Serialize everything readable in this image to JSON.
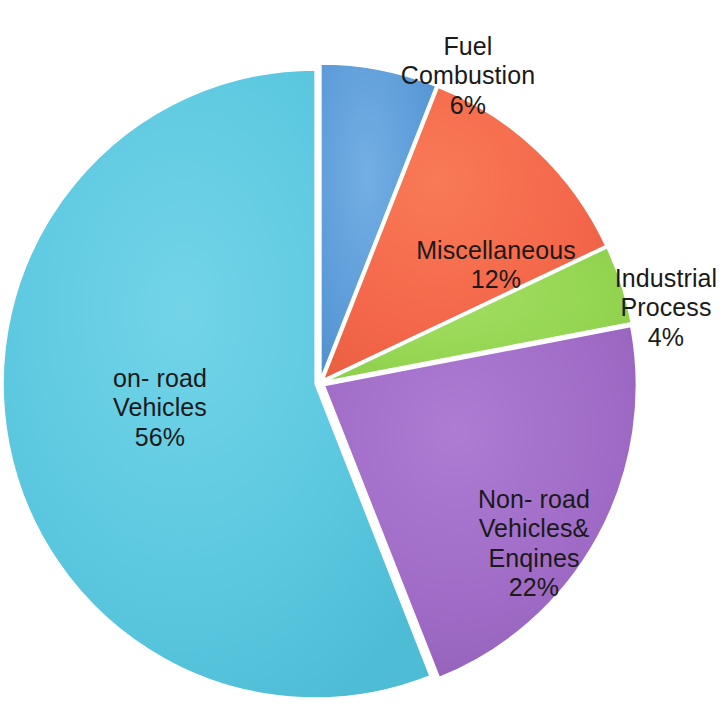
{
  "chart_data": {
    "type": "pie",
    "title": "",
    "subtitle": "",
    "xlabel": "",
    "ylabel": "",
    "legend_position": "none",
    "grid": false,
    "unit": "%",
    "start_angle_deg": 0,
    "direction": "clockwise",
    "categories": [
      "Fuel Combustion",
      "Miscellaneous",
      "Industrial Process",
      "Non- road Vehicles& Enqines",
      "on- road Vehicles"
    ],
    "values": [
      6,
      12,
      4,
      22,
      56
    ],
    "slices": [
      {
        "id": "fuel-combustion",
        "name": "Fuel Combustion",
        "label_line1": "Fuel",
        "label_line2": "Combustion",
        "value": 6,
        "value_label": "6%",
        "color": "#5b9bd8",
        "start_deg": 0,
        "end_deg": 21.6
      },
      {
        "id": "miscellaneous",
        "name": "Miscellaneous",
        "label_line1": "Miscellaneous",
        "label_line2": "",
        "value": 12,
        "value_label": "12%",
        "color": "#f4674a",
        "start_deg": 21.6,
        "end_deg": 64.8
      },
      {
        "id": "industrial-process",
        "name": "Industrial Process",
        "label_line1": "Industrial",
        "label_line2": "Process",
        "value": 4,
        "value_label": "4%",
        "color": "#93d551",
        "start_deg": 64.8,
        "end_deg": 79.2
      },
      {
        "id": "nonroad-vehicles-engines",
        "name": "Non- road Vehicles& Enqines",
        "label_line1": "Non- road",
        "label_line2": "Vehicles&",
        "label_line3": "Enqines",
        "value": 22,
        "value_label": "22%",
        "color": "#9f6bc6",
        "start_deg": 79.2,
        "end_deg": 158.4
      },
      {
        "id": "onroad-vehicles",
        "name": "on- road Vehicles",
        "label_line1": "on- road",
        "label_line2": "Vehicles",
        "value": 56,
        "value_label": "56%",
        "color": "#5bc8e0",
        "start_deg": 158.4,
        "end_deg": 360
      }
    ]
  },
  "labels": {
    "fuel_combustion": "Fuel\nCombustion",
    "fuel_combustion_pct": "6%",
    "miscellaneous": "Miscellaneous",
    "miscellaneous_pct": "12%",
    "industrial_process": "Industrial\nProcess",
    "industrial_process_pct": "4%",
    "nonroad": "Non- road\nVehicles&\nEnqines",
    "nonroad_pct": "22%",
    "onroad": "on- road\nVehicles",
    "onroad_pct": "56%"
  },
  "colors": {
    "fuel_combustion": "#5b9bd8",
    "miscellaneous": "#f4674a",
    "industrial_process": "#93d551",
    "nonroad": "#9f6bc6",
    "onroad": "#5bc8e0",
    "background": "#ffffff",
    "label_text": "#1a1a1a"
  }
}
